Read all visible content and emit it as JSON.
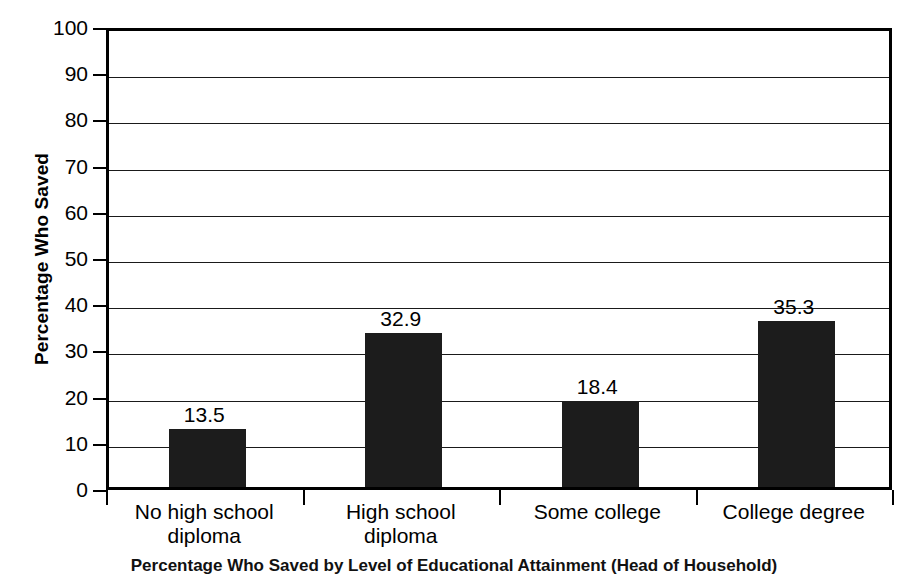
{
  "chart_data": {
    "type": "bar",
    "title": "",
    "xlabel": "",
    "ylabel": "Percentage Who Saved",
    "categories": [
      "No high school diploma",
      "High school diploma",
      "Some college",
      "College degree"
    ],
    "category_lines": [
      [
        "No high school",
        "diploma"
      ],
      [
        "High school",
        "diploma"
      ],
      [
        "Some college",
        ""
      ],
      [
        "College degree",
        ""
      ]
    ],
    "values": [
      13.5,
      32.9,
      18.4,
      35.3
    ],
    "bar_tops": [
      12.5,
      33.4,
      18.6,
      36.0
    ],
    "data_labels": [
      "13.5",
      "32.9",
      "18.4",
      "35.3"
    ],
    "ylim": [
      0,
      100
    ],
    "ytick_step": 10,
    "yticks": [
      0,
      10,
      20,
      30,
      40,
      50,
      60,
      70,
      80,
      90,
      100
    ],
    "ytick_labels": [
      "0",
      "10",
      "20",
      "30",
      "40",
      "50",
      "60",
      "70",
      "80",
      "90",
      "100"
    ],
    "grid": true,
    "grid_axis": "y",
    "legend": false,
    "bar_color": "#1c1c1c",
    "axis_color": "#000000",
    "background_color": "#ffffff"
  },
  "caption": {
    "text": "Percentage Who Saved by Level of Educational Attainment (Head of Household)"
  }
}
